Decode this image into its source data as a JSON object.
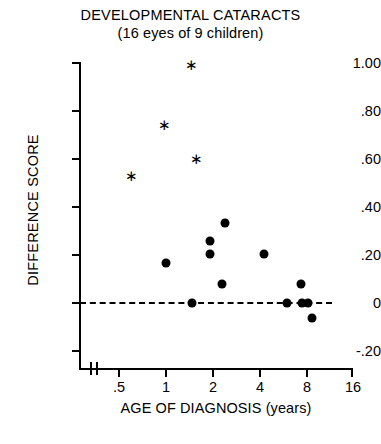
{
  "chart_data": {
    "type": "scatter",
    "title": "DEVELOPMENTAL CATARACTS",
    "subtitle": "(16 eyes of 9 children)",
    "xlabel": "AGE OF DIAGNOSIS (years)",
    "ylabel": "DIFFERENCE SCORE",
    "x_scale": "log2",
    "x_ticks": [
      0.5,
      1,
      2,
      4,
      8,
      16
    ],
    "x_tick_labels": [
      ".5",
      "1",
      "2",
      "4",
      "8",
      "16"
    ],
    "xlim": [
      0.5,
      16
    ],
    "y_ticks": [
      1.0,
      0.8,
      0.6,
      0.4,
      0.2,
      0,
      -0.2
    ],
    "y_tick_labels": [
      "1.00",
      ".80",
      ".60",
      ".40",
      ".20",
      "0",
      "-.20"
    ],
    "ylim": [
      -0.2,
      1.0
    ],
    "grid": false,
    "legend": null,
    "axis_break": true,
    "reference_line": {
      "y": 0,
      "style": "dashed"
    },
    "series": [
      {
        "name": "asterisk-markers",
        "marker": "asterisk",
        "points": [
          {
            "x": 1.5,
            "y": 0.99
          },
          {
            "x": 1.0,
            "y": 0.74
          },
          {
            "x": 1.6,
            "y": 0.6
          },
          {
            "x": 0.61,
            "y": 0.53
          }
        ]
      },
      {
        "name": "filled-circle-markers",
        "marker": "circle",
        "points": [
          {
            "x": 1.02,
            "y": 0.165
          },
          {
            "x": 1.95,
            "y": 0.258
          },
          {
            "x": 1.95,
            "y": 0.205
          },
          {
            "x": 2.45,
            "y": 0.333
          },
          {
            "x": 2.35,
            "y": 0.08
          },
          {
            "x": 4.4,
            "y": 0.205
          },
          {
            "x": 1.5,
            "y": 0.0
          },
          {
            "x": 6.15,
            "y": 0.0
          },
          {
            "x": 7.7,
            "y": 0.0
          },
          {
            "x": 8.45,
            "y": 0.0
          },
          {
            "x": 7.55,
            "y": 0.08
          },
          {
            "x": 8.9,
            "y": -0.063
          }
        ]
      }
    ]
  },
  "icons": {
    "asterisk_glyph": "✳"
  }
}
